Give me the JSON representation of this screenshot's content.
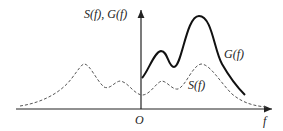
{
  "figure": {
    "y_axis_label": "S(f), G(f)",
    "x_axis_label": "f",
    "origin_label": "O",
    "curves": [
      {
        "name": "G(f)",
        "style": "solid",
        "color": "#111111"
      },
      {
        "name": "S(f)",
        "style": "dashed",
        "color": "#555555"
      }
    ]
  }
}
